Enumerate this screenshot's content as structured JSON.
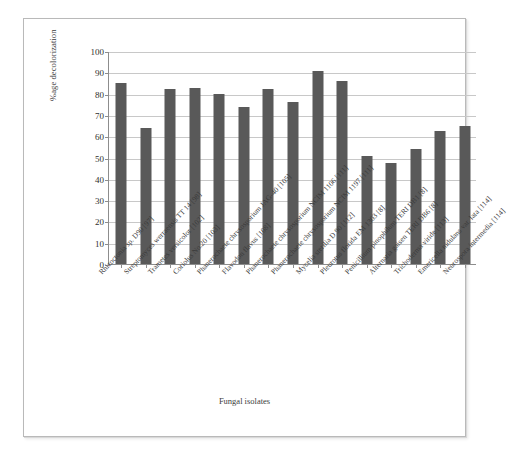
{
  "chart_data": {
    "type": "bar",
    "title": "",
    "xlabel": "Fungal isolates",
    "ylabel": "%age decolorization",
    "ylim": [
      0,
      100
    ],
    "ytick_labels": [
      "100",
      "90",
      "80",
      "70",
      "60",
      "50",
      "40",
      "30",
      "20",
      "10",
      "0"
    ],
    "ytick_values": [
      100,
      90,
      80,
      70,
      60,
      50,
      40,
      30,
      20,
      10,
      0
    ],
    "grid": "horizontal",
    "legend": "none",
    "bar_color": "#595959",
    "categories": [
      "Rhizoctonia sp. D90 [97]",
      "Streptomyces werraensis TT 14 [98]",
      "Trametes versicolor [102]",
      "Coriolus No.20 [103]",
      "Phanerochaete chrysosporium JAG-40 [105]",
      "Flavodon flavus [108]",
      "Phanerochaete chrysosporium NCIM 1106 [111]",
      "Phanerochaete chrysosporium NCIM 1197 [111]",
      "Mycelia sterilia D 90 [112]",
      "Pleurotus florida EM 1303 [8]",
      "Penicillium pinophilum TERI DB1 [8]",
      "Alternaria gaisen TERI DB6 [8]",
      "Trichoderma viride [113]",
      "Emericella nidulans var. lata [114]",
      "Neurospora intermedia [114]"
    ],
    "values": [
      85,
      64,
      82,
      82.5,
      80,
      73.5,
      82,
      76,
      90.5,
      86,
      50.5,
      47.5,
      54,
      62.5,
      65
    ]
  }
}
